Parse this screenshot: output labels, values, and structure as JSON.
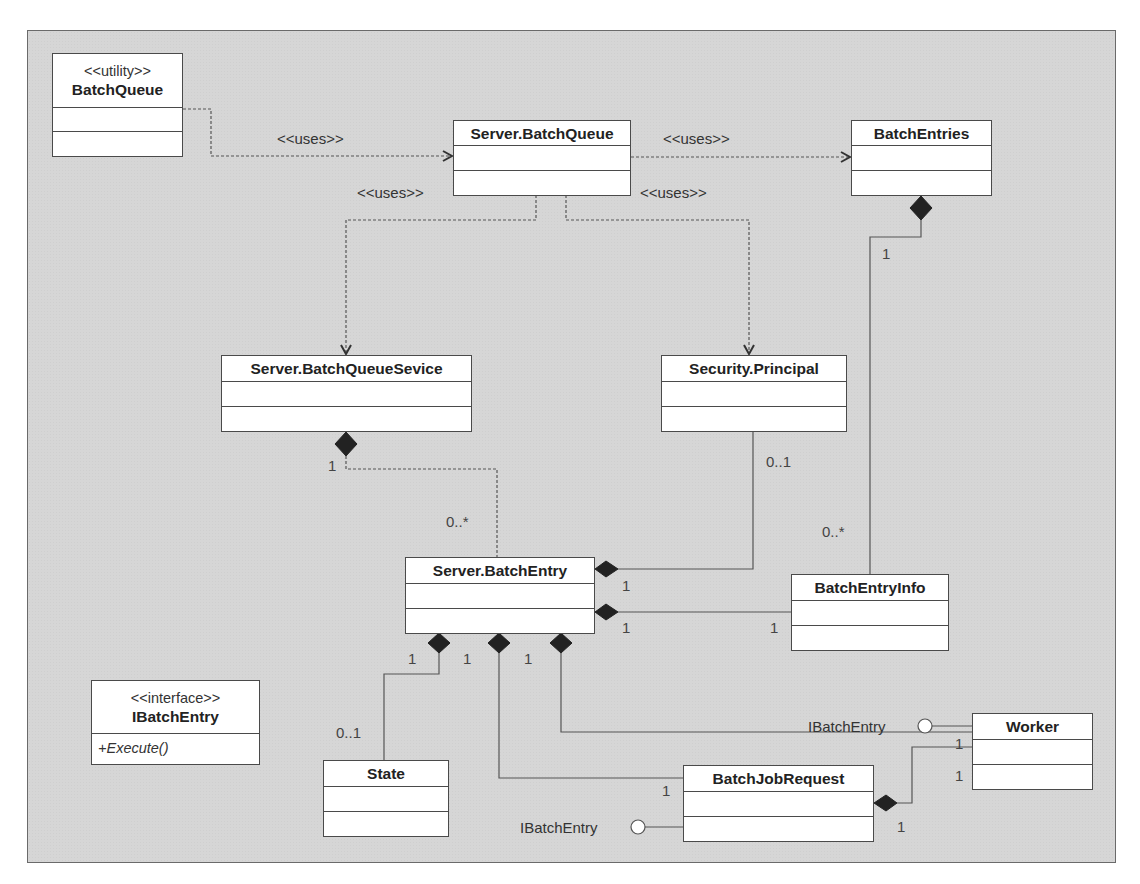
{
  "diagram": {
    "type": "UML class diagram",
    "classes": {
      "batch_queue_utility": {
        "stereotype": "<<utility>>",
        "name": "BatchQueue"
      },
      "server_batch_queue": {
        "name": "Server.BatchQueue"
      },
      "batch_entries": {
        "name": "BatchEntries"
      },
      "server_batch_queue_service": {
        "name": "Server.BatchQueueSevice"
      },
      "security_principal": {
        "name": "Security.Principal"
      },
      "server_batch_entry": {
        "name": "Server.BatchEntry"
      },
      "batch_entry_info": {
        "name": "BatchEntryInfo"
      },
      "ibatch_entry": {
        "stereotype": "<<interface>>",
        "name": "IBatchEntry",
        "operations": [
          "+Execute()"
        ]
      },
      "state": {
        "name": "State"
      },
      "batch_job_request": {
        "name": "BatchJobRequest"
      },
      "worker": {
        "name": "Worker"
      }
    },
    "dependency_labels": {
      "utility_to_server_queue": "<<uses>>",
      "server_queue_to_entries": "<<uses>>",
      "server_queue_to_service": "<<uses>>",
      "server_queue_to_principal": "<<uses>>"
    },
    "interface_lollipops": {
      "worker": "IBatchEntry",
      "batch_job_request": "IBatchEntry"
    },
    "multiplicities": {
      "entries_to_info_entries_end": "1",
      "entries_to_info_info_end": "0..*",
      "service_to_entry_service_end": "1",
      "service_to_entry_entry_end": "0..*",
      "principal_to_entry_principal_end": "0..1",
      "principal_to_entry_entry_end": "1",
      "entry_to_info_entry_end": "1",
      "entry_to_info_info_end": "1",
      "entry_to_state_entry_end": "1",
      "entry_to_state_state_end": "0..1",
      "entry_to_jobrequest_entry_end": "1",
      "entry_to_jobrequest_request_end": "1",
      "entry_to_worker_entry_end": "1",
      "entry_to_worker_worker_end": "1",
      "jobrequest_to_worker_request_end": "1",
      "jobrequest_to_worker_worker_end": "1"
    }
  }
}
